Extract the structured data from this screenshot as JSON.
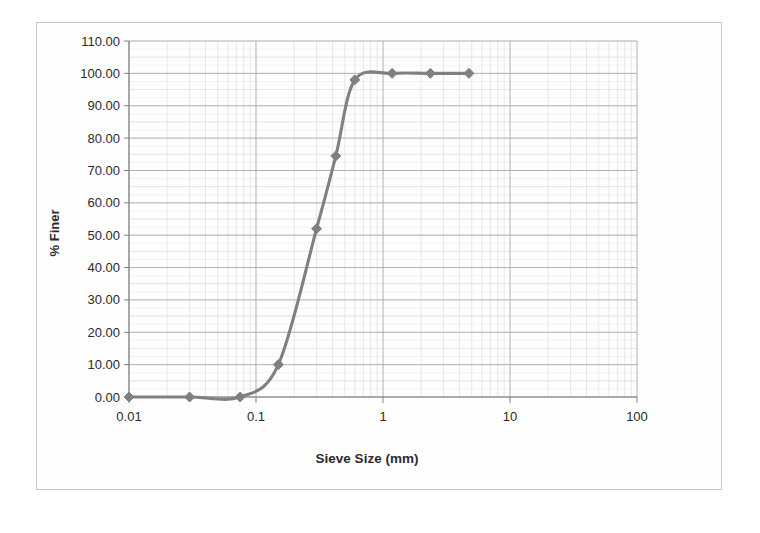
{
  "chart_data": {
    "type": "line",
    "title": "",
    "xlabel": "Sieve Size (mm)",
    "ylabel": "% Finer",
    "xscale": "log",
    "xlim": [
      0.01,
      100
    ],
    "ylim": [
      0,
      110
    ],
    "grid": true,
    "minor_grid": true,
    "legend": false,
    "legend_position": "none",
    "xticks": [
      "0.01",
      "0.1",
      "1",
      "10",
      "100"
    ],
    "xtick_values": [
      0.01,
      0.1,
      1,
      10,
      100
    ],
    "yticks": [
      "0.00",
      "10.00",
      "20.00",
      "30.00",
      "40.00",
      "50.00",
      "60.00",
      "70.00",
      "80.00",
      "90.00",
      "100.00",
      "110.00"
    ],
    "ytick_values": [
      0,
      10,
      20,
      30,
      40,
      50,
      60,
      70,
      80,
      90,
      100,
      110
    ],
    "series": [
      {
        "name": "Grain size distribution",
        "color": "#808080",
        "marker": "diamond",
        "x": [
          0.01,
          0.03,
          0.075,
          0.15,
          0.3,
          0.425,
          0.6,
          1.18,
          2.36,
          4.75
        ],
        "y": [
          0.0,
          0.0,
          0.0,
          10.0,
          52.0,
          74.5,
          98.0,
          100.0,
          100.0,
          100.0
        ]
      }
    ]
  },
  "style": {
    "line_color": "#808080",
    "marker_color": "#808080",
    "axis_color": "#808080",
    "major_grid_color": "#a9a9a9",
    "minor_grid_color": "#d8d8d8",
    "text_color": "#2b2b2b",
    "frame_color": "#c9c9c9",
    "background": "#ffffff"
  }
}
